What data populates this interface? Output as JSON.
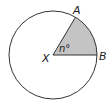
{
  "diagram": {
    "type": "circle-sector",
    "center_label": "X",
    "points": [
      {
        "label": "A"
      },
      {
        "label": "B"
      }
    ],
    "angle_label": "n°",
    "colors": {
      "stroke": "#333333",
      "sector_fill": "#c4c4c4",
      "background": "#ffffff"
    }
  }
}
